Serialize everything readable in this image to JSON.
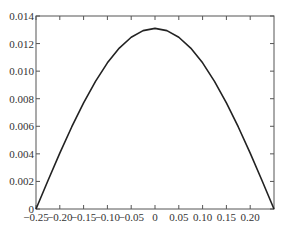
{
  "chart_data": {
    "type": "line",
    "title": "",
    "xlabel": "",
    "ylabel": "",
    "xlim": [
      -0.25,
      0.25
    ],
    "ylim": [
      0,
      0.014
    ],
    "grid": false,
    "legend": null,
    "x_ticks": [
      -0.25,
      -0.2,
      -0.15,
      -0.1,
      -0.05,
      0,
      0.05,
      0.1,
      0.15,
      0.2
    ],
    "x_tick_labels": [
      "−0.25",
      "−0.20",
      "−0.15",
      "−0.10",
      "−0.05",
      "0",
      "0.05",
      "0.10",
      "0.15",
      "0.20"
    ],
    "y_ticks": [
      0,
      0.002,
      0.004,
      0.006,
      0.008,
      0.01,
      0.012,
      0.014
    ],
    "y_tick_labels": [
      "0",
      "0.002",
      "0.004",
      "0.006",
      "0.008",
      "0.010",
      "0.012",
      "0.014"
    ],
    "series": [
      {
        "name": "curve",
        "color": "#222222",
        "x": [
          -0.25,
          -0.225,
          -0.2,
          -0.175,
          -0.15,
          -0.125,
          -0.1,
          -0.075,
          -0.05,
          -0.025,
          0,
          0.025,
          0.05,
          0.075,
          0.1,
          0.125,
          0.15,
          0.175,
          0.2,
          0.225,
          0.25
        ],
        "values": [
          0.0,
          0.00205,
          0.00405,
          0.00595,
          0.0077,
          0.00926,
          0.0106,
          0.01167,
          0.01246,
          0.01294,
          0.0131,
          0.01294,
          0.01246,
          0.01167,
          0.0106,
          0.00926,
          0.0077,
          0.00595,
          0.00405,
          0.00205,
          0.0
        ]
      }
    ]
  },
  "colors": {
    "axis": "#555555",
    "text": "#333333",
    "line": "#222222",
    "background": "#ffffff"
  }
}
